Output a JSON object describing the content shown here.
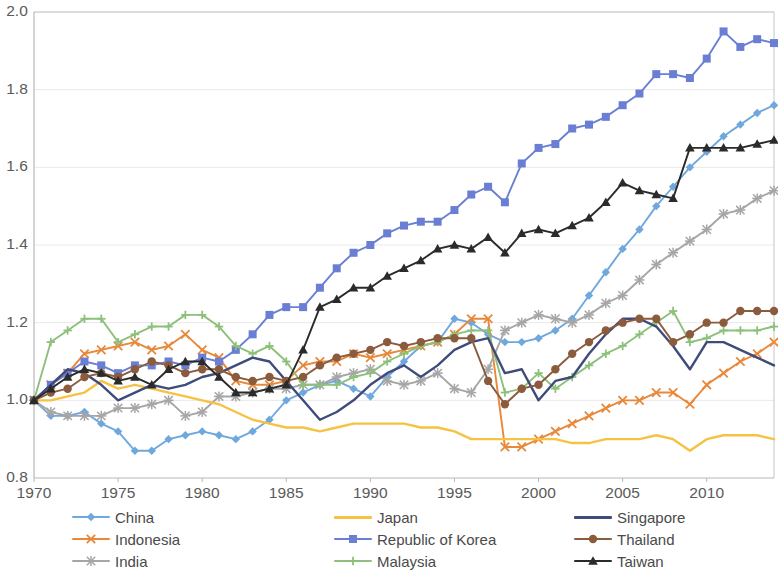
{
  "chart_data": {
    "type": "line",
    "title": "",
    "subtitle": "",
    "xlabel": "",
    "ylabel": "",
    "xlim": [
      1970,
      2014
    ],
    "ylim": [
      0.8,
      2.0
    ],
    "ytick_values": [
      0.8,
      1.0,
      1.2,
      1.4,
      1.6,
      1.8,
      2.0
    ],
    "ytick_labels": [
      "0.8",
      "1.0",
      "1.2",
      "1.4",
      "1.6",
      "1.8",
      "2.0"
    ],
    "xtick_values": [
      1970,
      1975,
      1980,
      1985,
      1990,
      1995,
      2000,
      2005,
      2010
    ],
    "xtick_labels": [
      "1970",
      "1975",
      "1980",
      "1985",
      "1990",
      "1995",
      "2000",
      "2005",
      "2010"
    ],
    "grid": true,
    "grid_axis": "y",
    "legend_position": "bottom",
    "legend_columns": 3,
    "x": [
      1970,
      1971,
      1972,
      1973,
      1974,
      1975,
      1976,
      1977,
      1978,
      1979,
      1980,
      1981,
      1982,
      1983,
      1984,
      1985,
      1986,
      1987,
      1988,
      1989,
      1990,
      1991,
      1992,
      1993,
      1994,
      1995,
      1996,
      1997,
      1998,
      1999,
      2000,
      2001,
      2002,
      2003,
      2004,
      2005,
      2006,
      2007,
      2008,
      2009,
      2010,
      2011,
      2012,
      2013,
      2014
    ],
    "series": [
      {
        "name": "China",
        "color": "#6fa8dc",
        "marker": "diamond",
        "values": [
          1.0,
          0.96,
          0.96,
          0.97,
          0.94,
          0.92,
          0.87,
          0.87,
          0.9,
          0.91,
          0.92,
          0.91,
          0.9,
          0.92,
          0.95,
          1.0,
          1.02,
          1.04,
          1.05,
          1.03,
          1.01,
          1.06,
          1.1,
          1.14,
          1.15,
          1.21,
          1.2,
          1.17,
          1.15,
          1.15,
          1.16,
          1.18,
          1.21,
          1.27,
          1.33,
          1.39,
          1.44,
          1.5,
          1.55,
          1.6,
          1.64,
          1.68,
          1.71,
          1.74,
          1.76
        ]
      },
      {
        "name": "Indonesia",
        "color": "#e8883a",
        "marker": "x",
        "values": [
          1.0,
          1.04,
          1.07,
          1.12,
          1.13,
          1.14,
          1.15,
          1.13,
          1.14,
          1.17,
          1.13,
          1.11,
          1.05,
          1.04,
          1.04,
          1.05,
          1.09,
          1.1,
          1.1,
          1.12,
          1.11,
          1.12,
          1.13,
          1.14,
          1.15,
          1.17,
          1.21,
          1.21,
          0.88,
          0.88,
          0.9,
          0.92,
          0.94,
          0.96,
          0.98,
          1.0,
          1.0,
          1.02,
          1.02,
          0.99,
          1.04,
          1.07,
          1.1,
          1.12,
          1.15
        ]
      },
      {
        "name": "India",
        "color": "#a6a6a6",
        "marker": "asterisk",
        "values": [
          1.0,
          0.97,
          0.96,
          0.96,
          0.96,
          0.98,
          0.98,
          0.99,
          1.0,
          0.96,
          0.97,
          1.01,
          1.01,
          1.02,
          1.03,
          1.03,
          1.04,
          1.04,
          1.06,
          1.07,
          1.08,
          1.05,
          1.04,
          1.05,
          1.07,
          1.03,
          1.02,
          1.08,
          1.18,
          1.2,
          1.22,
          1.21,
          1.2,
          1.22,
          1.25,
          1.27,
          1.31,
          1.35,
          1.38,
          1.41,
          1.44,
          1.48,
          1.49,
          1.52,
          1.54
        ]
      },
      {
        "name": "Japan",
        "color": "#f5c242",
        "marker": "none",
        "values": [
          1.0,
          1.0,
          1.01,
          1.02,
          1.05,
          1.03,
          1.04,
          1.03,
          1.02,
          1.01,
          1.0,
          0.99,
          0.97,
          0.95,
          0.94,
          0.93,
          0.93,
          0.92,
          0.93,
          0.94,
          0.94,
          0.94,
          0.94,
          0.93,
          0.93,
          0.92,
          0.9,
          0.9,
          0.9,
          0.9,
          0.9,
          0.9,
          0.89,
          0.89,
          0.9,
          0.9,
          0.9,
          0.91,
          0.9,
          0.87,
          0.9,
          0.91,
          0.91,
          0.91,
          0.9
        ]
      },
      {
        "name": "Republic of Korea",
        "color": "#6a7fd4",
        "marker": "square",
        "values": [
          1.0,
          1.04,
          1.07,
          1.1,
          1.09,
          1.07,
          1.09,
          1.09,
          1.1,
          1.09,
          1.11,
          1.1,
          1.13,
          1.17,
          1.22,
          1.24,
          1.24,
          1.29,
          1.34,
          1.38,
          1.4,
          1.43,
          1.45,
          1.46,
          1.46,
          1.49,
          1.53,
          1.55,
          1.51,
          1.61,
          1.65,
          1.66,
          1.7,
          1.71,
          1.73,
          1.76,
          1.79,
          1.84,
          1.84,
          1.83,
          1.88,
          1.95,
          1.91,
          1.93,
          1.92
        ]
      },
      {
        "name": "Malaysia",
        "color": "#8dc07a",
        "marker": "plus",
        "values": [
          1.0,
          1.15,
          1.18,
          1.21,
          1.21,
          1.15,
          1.17,
          1.19,
          1.19,
          1.22,
          1.22,
          1.19,
          1.14,
          1.12,
          1.14,
          1.1,
          1.04,
          1.04,
          1.04,
          1.06,
          1.07,
          1.1,
          1.12,
          1.14,
          1.15,
          1.17,
          1.18,
          1.18,
          1.02,
          1.03,
          1.07,
          1.03,
          1.06,
          1.09,
          1.12,
          1.14,
          1.17,
          1.2,
          1.23,
          1.15,
          1.16,
          1.18,
          1.18,
          1.18,
          1.19
        ]
      },
      {
        "name": "Singapore",
        "color": "#3f4b7a",
        "marker": "none",
        "values": [
          1.0,
          1.04,
          1.08,
          1.07,
          1.04,
          1.0,
          1.02,
          1.04,
          1.03,
          1.04,
          1.06,
          1.07,
          1.09,
          1.11,
          1.1,
          1.05,
          1.0,
          0.95,
          0.97,
          1.0,
          1.04,
          1.07,
          1.09,
          1.06,
          1.09,
          1.13,
          1.15,
          1.16,
          1.07,
          1.08,
          1.0,
          1.05,
          1.06,
          1.12,
          1.17,
          1.21,
          1.21,
          1.19,
          1.14,
          1.08,
          1.15,
          1.15,
          1.13,
          1.11,
          1.09
        ]
      },
      {
        "name": "Thailand",
        "color": "#8b5b3d",
        "marker": "circle",
        "values": [
          1.0,
          1.02,
          1.03,
          1.06,
          1.07,
          1.06,
          1.08,
          1.1,
          1.09,
          1.07,
          1.08,
          1.08,
          1.06,
          1.05,
          1.06,
          1.05,
          1.06,
          1.09,
          1.11,
          1.12,
          1.13,
          1.15,
          1.14,
          1.15,
          1.16,
          1.16,
          1.16,
          1.05,
          0.99,
          1.03,
          1.04,
          1.08,
          1.12,
          1.15,
          1.18,
          1.2,
          1.21,
          1.21,
          1.15,
          1.17,
          1.2,
          1.2,
          1.23,
          1.23,
          1.23
        ]
      },
      {
        "name": "Taiwan",
        "color": "#2b2b2b",
        "marker": "triangle",
        "values": [
          1.0,
          1.03,
          1.06,
          1.08,
          1.07,
          1.05,
          1.06,
          1.04,
          1.08,
          1.1,
          1.1,
          1.06,
          1.02,
          1.02,
          1.03,
          1.04,
          1.13,
          1.24,
          1.26,
          1.29,
          1.29,
          1.32,
          1.34,
          1.36,
          1.39,
          1.4,
          1.39,
          1.42,
          1.38,
          1.43,
          1.44,
          1.43,
          1.45,
          1.47,
          1.51,
          1.56,
          1.54,
          1.53,
          1.52,
          1.65,
          1.65,
          1.65,
          1.65,
          1.66,
          1.67
        ]
      }
    ]
  },
  "legend": {
    "items": [
      {
        "label": "China"
      },
      {
        "label": "Indonesia"
      },
      {
        "label": "India"
      },
      {
        "label": "Japan"
      },
      {
        "label": "Republic of Korea"
      },
      {
        "label": "Malaysia"
      },
      {
        "label": "Singapore"
      },
      {
        "label": "Thailand"
      },
      {
        "label": "Taiwan"
      }
    ]
  },
  "colors": {
    "axis": "#b8b8b8",
    "grid": "#e9e9ec",
    "tick_text": "#5a5a5a",
    "legend_text": "#4a4a4a",
    "background": "#ffffff"
  }
}
